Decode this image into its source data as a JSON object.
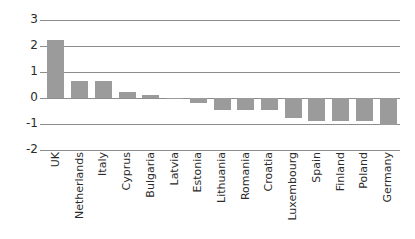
{
  "chart_data": {
    "type": "bar",
    "title": "",
    "subtitle": "",
    "xlabel": "",
    "ylabel": "",
    "ylim": [
      -2,
      3
    ],
    "ytick_labels": [
      "3",
      "2",
      "1",
      "0",
      "-1",
      "-2"
    ],
    "yticks": [
      3,
      2,
      1,
      0,
      -1,
      -2
    ],
    "grid": true,
    "legend": null,
    "bar_color": "#9b9b9b",
    "axis_color": "#8d8d8d",
    "categories": [
      "UK",
      "Netherlands",
      "Italy",
      "Cyprus",
      "Bulgaria",
      "Latvia",
      "Estonia",
      "Lithuania",
      "Romania",
      "Croatia",
      "Luxembourg",
      "Spain",
      "Finland",
      "Poland",
      "Germany"
    ],
    "values": [
      2.23,
      0.67,
      0.67,
      0.25,
      0.1,
      -0.05,
      -0.2,
      -0.45,
      -0.45,
      -0.45,
      -0.78,
      -0.88,
      -0.9,
      -0.9,
      -1.05
    ]
  }
}
